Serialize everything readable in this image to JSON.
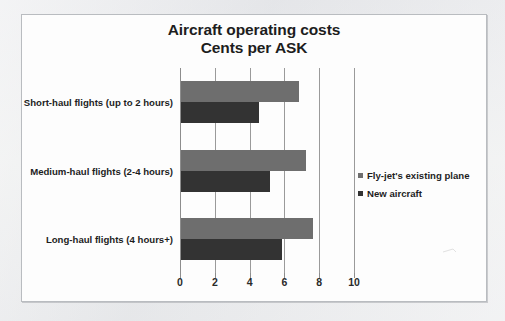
{
  "chart_data": {
    "type": "bar",
    "orientation": "horizontal",
    "title": "Aircraft operating costs",
    "subtitle": "Cents per ASK",
    "xlabel": "",
    "ylabel": "",
    "xlim": [
      0,
      10
    ],
    "xticks": [
      "0",
      "2",
      "4",
      "6",
      "8",
      "10"
    ],
    "xtick_values": [
      0,
      2,
      4,
      6,
      8,
      10
    ],
    "grid": true,
    "grid_axis": "x",
    "legend_position": "right",
    "categories": [
      "Short-haul flights (up to 2 hours)",
      "Medium-haul flights (2-4 hours)",
      "Long-haul flights (4 hours+)"
    ],
    "series": [
      {
        "name": "Fly-jet's existing plane",
        "color": "#6e6e6e",
        "values": [
          6.8,
          7.2,
          7.6
        ]
      },
      {
        "name": "New aircraft",
        "color": "#333333",
        "values": [
          4.5,
          5.1,
          5.8
        ]
      }
    ]
  },
  "style": {
    "page_background": "#e9eaec",
    "chart_background": "#fdfdfd",
    "frame_border": "#b9bcc0",
    "axis_color": "#8d8d8d",
    "text_color": "#1d1d1d"
  }
}
